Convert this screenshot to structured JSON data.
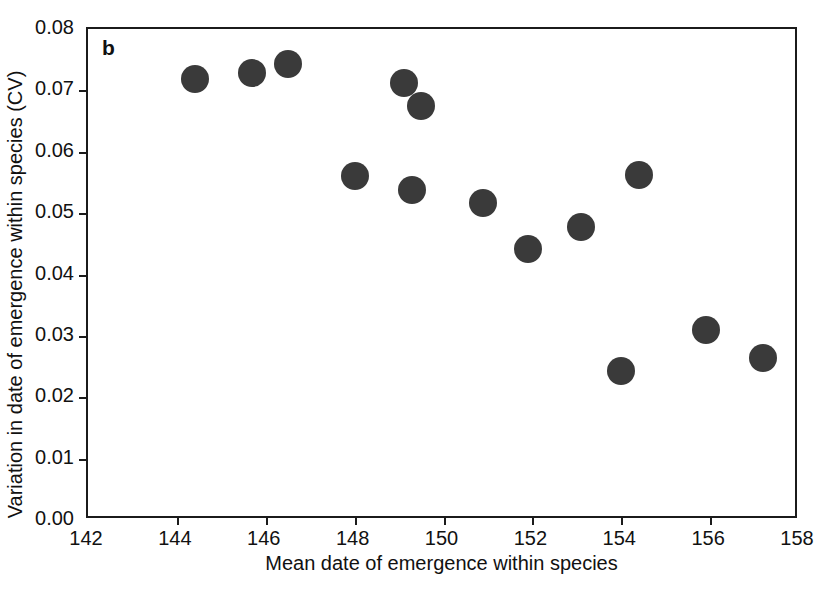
{
  "figure": {
    "panel_label": "b",
    "background_color": "#ffffff",
    "frame_color": "#1b1b1b",
    "marker_color": "#3a3a3a"
  },
  "chart_data": {
    "type": "scatter",
    "title": "",
    "panel": "b",
    "xlabel": "Mean date of emergence within species",
    "ylabel": "Variation in date of emergence within species (CV)",
    "xlim": [
      142,
      158
    ],
    "ylim": [
      0.0,
      0.08
    ],
    "xticks": [
      142,
      144,
      146,
      148,
      150,
      152,
      154,
      156,
      158
    ],
    "xtick_labels": [
      "142",
      "144",
      "146",
      "148",
      "150",
      "152",
      "154",
      "156",
      "158"
    ],
    "yticks": [
      0.0,
      0.01,
      0.02,
      0.03,
      0.04,
      0.05,
      0.06,
      0.07,
      0.08
    ],
    "ytick_labels": [
      "0.00",
      "0.01",
      "0.02",
      "0.03",
      "0.04",
      "0.05",
      "0.06",
      "0.07",
      "0.08"
    ],
    "grid": false,
    "legend": null,
    "marker": "filled-circle",
    "points": [
      {
        "x": 144.4,
        "y": 0.0718
      },
      {
        "x": 145.7,
        "y": 0.0728
      },
      {
        "x": 146.5,
        "y": 0.0743
      },
      {
        "x": 148.0,
        "y": 0.056
      },
      {
        "x": 149.1,
        "y": 0.0712
      },
      {
        "x": 149.3,
        "y": 0.0537
      },
      {
        "x": 149.5,
        "y": 0.0674
      },
      {
        "x": 150.9,
        "y": 0.0516
      },
      {
        "x": 151.9,
        "y": 0.0441
      },
      {
        "x": 153.1,
        "y": 0.0478
      },
      {
        "x": 154.0,
        "y": 0.0242
      },
      {
        "x": 154.4,
        "y": 0.0562
      },
      {
        "x": 155.9,
        "y": 0.0309
      },
      {
        "x": 157.2,
        "y": 0.0264
      }
    ]
  }
}
